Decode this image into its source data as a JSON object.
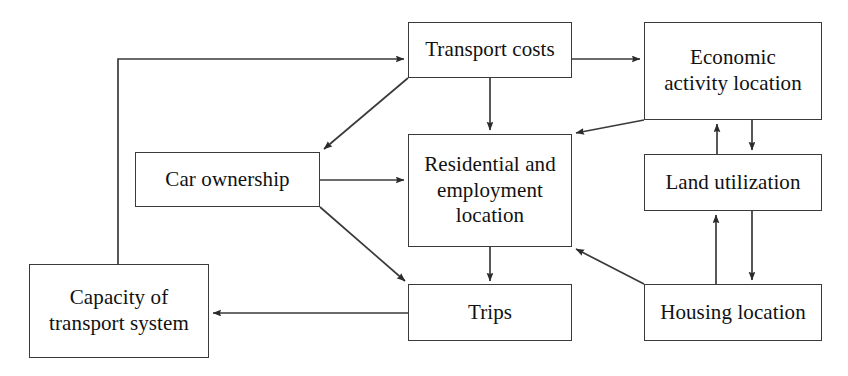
{
  "diagram": {
    "type": "flow-diagram",
    "canvas": {
      "width": 848,
      "height": 376
    },
    "style": {
      "box_fill": "#ffffff",
      "box_stroke": "#3a3a3a",
      "line_color": "#3a3a3a",
      "text_color": "#111111",
      "background": "#ffffff"
    },
    "nodes": [
      {
        "id": "transport-costs",
        "label": "Transport costs",
        "x": 408,
        "y": 22,
        "w": 164,
        "h": 56
      },
      {
        "id": "economic-activity-location",
        "label": "Economic\nactivity location",
        "x": 644,
        "y": 22,
        "w": 178,
        "h": 98
      },
      {
        "id": "car-ownership",
        "label": "Car ownership",
        "x": 135,
        "y": 152,
        "w": 185,
        "h": 55
      },
      {
        "id": "residential-and-employment-location",
        "label": "Residential and\nemployment\nlocation",
        "x": 408,
        "y": 134,
        "w": 164,
        "h": 113
      },
      {
        "id": "land-utilization",
        "label": "Land utilization",
        "x": 644,
        "y": 154,
        "w": 178,
        "h": 57
      },
      {
        "id": "capacity-of-transport-system",
        "label": "Capacity of\ntransport system",
        "x": 29,
        "y": 264,
        "w": 180,
        "h": 94
      },
      {
        "id": "trips",
        "label": "Trips",
        "x": 408,
        "y": 284,
        "w": 164,
        "h": 57
      },
      {
        "id": "housing-location",
        "label": "Housing location",
        "x": 644,
        "y": 284,
        "w": 178,
        "h": 57
      }
    ],
    "edges": [
      {
        "id": "capacity-to-transport-costs",
        "from": "capacity-of-transport-system",
        "to": "transport-costs",
        "arrow": true
      },
      {
        "id": "transport-costs-to-economic-activity",
        "from": "transport-costs",
        "to": "economic-activity-location",
        "arrow": true
      },
      {
        "id": "transport-costs-to-residential",
        "from": "transport-costs",
        "to": "residential-and-employment-location",
        "arrow": true
      },
      {
        "id": "transport-costs-to-car-ownership",
        "from": "transport-costs",
        "to": "car-ownership",
        "arrow": true
      },
      {
        "id": "car-ownership-to-residential",
        "from": "car-ownership",
        "to": "residential-and-employment-location",
        "arrow": true
      },
      {
        "id": "car-ownership-to-trips",
        "from": "car-ownership",
        "to": "trips",
        "arrow": true
      },
      {
        "id": "economic-activity-to-residential",
        "from": "economic-activity-location",
        "to": "residential-and-employment-location",
        "arrow": true
      },
      {
        "id": "land-utilization-to-economic-activity",
        "from": "land-utilization",
        "to": "economic-activity-location",
        "arrow": true
      },
      {
        "id": "economic-activity-to-land-utilization",
        "from": "economic-activity-location",
        "to": "land-utilization",
        "arrow": true
      },
      {
        "id": "housing-location-to-land-utilization",
        "from": "housing-location",
        "to": "land-utilization",
        "arrow": true
      },
      {
        "id": "land-utilization-to-housing-location",
        "from": "land-utilization",
        "to": "housing-location",
        "arrow": true
      },
      {
        "id": "housing-location-to-residential",
        "from": "housing-location",
        "to": "residential-and-employment-location",
        "arrow": true
      },
      {
        "id": "residential-to-trips",
        "from": "residential-and-employment-location",
        "to": "trips",
        "arrow": true
      },
      {
        "id": "trips-to-capacity",
        "from": "trips",
        "to": "capacity-of-transport-system",
        "arrow": true
      }
    ]
  }
}
